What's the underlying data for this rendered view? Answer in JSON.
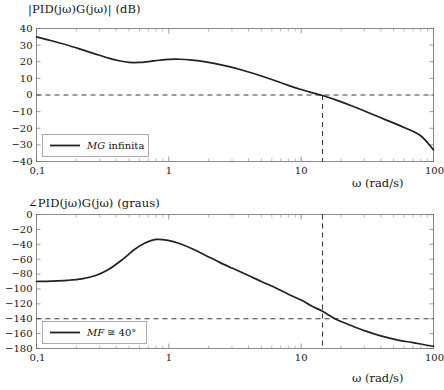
{
  "figure": {
    "kind": "bode-plot",
    "background": "#ffffff",
    "curve_color": "#222222",
    "dash_color": "#3a3a3a",
    "axis_color": "#6e6e6e"
  },
  "magnitude": {
    "title": "|PID(jω)G(jω)| (dB)",
    "xlabel": "ω (rad/s)",
    "legend_label": "MG infinita",
    "legend_label_italic": "MG",
    "legend_label_rest": "infinita",
    "x_ticks": [
      "0,1",
      "1",
      "10",
      "100"
    ],
    "y_ticks": [
      "40",
      "30",
      "20",
      "10",
      "0",
      "−10",
      "−20",
      "−30",
      "−40"
    ]
  },
  "phase": {
    "title": "∠PID(jω)G(jω) (graus)",
    "xlabel": "ω (rad/s)",
    "legend_label": "MF ≅ 40°",
    "legend_label_italic": "MF",
    "legend_label_rest": "≅ 40°",
    "x_ticks": [
      "0,1",
      "1",
      "10",
      "100"
    ],
    "y_ticks": [
      "0",
      "−20",
      "−40",
      "−60",
      "−80",
      "−100",
      "−120",
      "−140",
      "−160",
      "−180"
    ]
  },
  "chart_data": [
    {
      "type": "line",
      "title": "|PID(jω)G(jω)| (dB)",
      "xlabel": "ω (rad/s)",
      "ylabel": "|PID(jω)G(jω)| (dB)",
      "xscale": "log",
      "xlim": [
        0.1,
        100
      ],
      "ylim": [
        -40,
        40
      ],
      "xtick_values": [
        0.1,
        1,
        10,
        100
      ],
      "xtick_labels": [
        "0,1",
        "1",
        "10",
        "100"
      ],
      "ytick_values": [
        40,
        30,
        20,
        10,
        0,
        -10,
        -20,
        -30,
        -40
      ],
      "grid": false,
      "legend": {
        "position": "lower-left",
        "entries": [
          "MG infinita"
        ]
      },
      "series": [
        {
          "name": "|PID(jw)G(jw)|",
          "x": [
            0.1,
            0.13,
            0.17,
            0.22,
            0.28,
            0.35,
            0.42,
            0.5,
            0.6,
            0.7,
            0.85,
            1.0,
            1.2,
            1.5,
            1.8,
            2.2,
            2.8,
            3.5,
            4.5,
            6.0,
            8.0,
            10.0,
            12.0,
            14.5,
            18.0,
            24.0,
            32.0,
            45.0,
            60.0,
            80.0,
            100.0
          ],
          "y": [
            35.0,
            32.6,
            30.1,
            27.3,
            24.6,
            22.2,
            20.6,
            19.6,
            19.6,
            20.1,
            20.9,
            21.4,
            21.5,
            21.0,
            20.2,
            19.0,
            17.2,
            15.2,
            12.6,
            9.3,
            5.8,
            3.3,
            1.4,
            -0.3,
            -2.8,
            -6.5,
            -10.5,
            -15.4,
            -19.5,
            -24.5,
            -33.0
          ]
        }
      ],
      "annotations": [
        {
          "type": "hline",
          "y": 0,
          "style": "dashed",
          "label": "0 dB reference"
        },
        {
          "type": "vline",
          "x": 14.5,
          "style": "dashed",
          "label": "gain crossover frequency"
        }
      ],
      "gain_crossover_rad_s": 14.5,
      "gain_margin": "infinita"
    },
    {
      "type": "line",
      "title": "∠PID(jω)G(jω) (graus)",
      "xlabel": "ω (rad/s)",
      "ylabel": "∠PID(jω)G(jω) (graus)",
      "xscale": "log",
      "xlim": [
        0.1,
        100
      ],
      "ylim": [
        -180,
        0
      ],
      "xtick_values": [
        0.1,
        1,
        10,
        100
      ],
      "xtick_labels": [
        "0,1",
        "1",
        "10",
        "100"
      ],
      "ytick_values": [
        0,
        -20,
        -40,
        -60,
        -80,
        -100,
        -120,
        -140,
        -160,
        -180
      ],
      "grid": false,
      "legend": {
        "position": "lower-left",
        "entries": [
          "MF ≅ 40°"
        ]
      },
      "series": [
        {
          "name": "angle PID(jw)G(jw)",
          "x": [
            0.1,
            0.13,
            0.17,
            0.22,
            0.28,
            0.35,
            0.45,
            0.55,
            0.65,
            0.8,
            1.0,
            1.2,
            1.5,
            1.9,
            2.4,
            3.0,
            4.0,
            5.0,
            6.5,
            8.0,
            10.0,
            12.0,
            14.5,
            18.0,
            23.0,
            30.0,
            40.0,
            55.0,
            70.0,
            85.0,
            100.0
          ],
          "y": [
            -90.0,
            -89.5,
            -88.5,
            -86.5,
            -82.0,
            -74.0,
            -60.0,
            -47.0,
            -39.0,
            -33.5,
            -35.0,
            -39.0,
            -46.0,
            -55.0,
            -64.0,
            -72.0,
            -82.0,
            -90.0,
            -99.0,
            -107.0,
            -115.0,
            -123.0,
            -130.0,
            -140.0,
            -148.0,
            -156.0,
            -163.0,
            -169.0,
            -172.0,
            -175.0,
            -177.0
          ]
        }
      ],
      "annotations": [
        {
          "type": "hline",
          "y": -140,
          "style": "dashed",
          "label": "-140 degrees reference"
        },
        {
          "type": "vline",
          "x": 14.5,
          "style": "dashed",
          "label": "gain crossover frequency"
        }
      ],
      "phase_margin_deg": 40,
      "phase_margin_label": "MF ≅ 40°"
    }
  ]
}
